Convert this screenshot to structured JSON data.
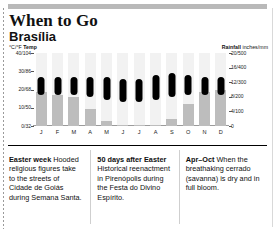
{
  "header": {
    "title": "When to Go",
    "subtitle": "Brasília"
  },
  "axes": {
    "left_label_units": "°C/°F",
    "left_label_name": "Temp",
    "right_label_name": "Rainfall",
    "right_label_units": "inches/mm"
  },
  "chart_data": {
    "type": "bar",
    "categories": [
      "J",
      "F",
      "M",
      "A",
      "M",
      "J",
      "J",
      "A",
      "S",
      "O",
      "N",
      "D"
    ],
    "month_labels": [
      "J",
      "F",
      "M",
      "A",
      "M",
      "J",
      "J",
      "A",
      "S",
      "O",
      "N",
      "D"
    ],
    "xlabel": "",
    "grid": false,
    "legend": "none",
    "series": [
      {
        "name": "Rainfall",
        "type": "bar",
        "unit": "inches/mm",
        "axis": "right",
        "ylabel": "Rainfall",
        "ylim": [
          0,
          20
        ],
        "ticks": [
          "0",
          "4/100",
          "8/200",
          "12/300",
          "16/400",
          "20/500"
        ],
        "tick_values": [
          0,
          4,
          8,
          12,
          16,
          20
        ],
        "values": [
          9.4,
          8.6,
          7.9,
          4.6,
          1.3,
          0.3,
          0.2,
          0.3,
          2.0,
          6.0,
          9.4,
          9.8
        ],
        "values_mm": [
          235,
          215,
          198,
          115,
          33,
          8,
          5,
          8,
          50,
          150,
          235,
          245
        ]
      },
      {
        "name": "Temperature range",
        "type": "range",
        "unit": "°C/°F",
        "axis": "left",
        "ylabel": "Temp",
        "ylim": [
          0,
          40
        ],
        "ticks": [
          "0/32",
          "10/50",
          "20/68",
          "30/86",
          "40/104"
        ],
        "tick_values": [
          0,
          10,
          20,
          30,
          40
        ],
        "low_c": [
          17,
          17,
          17,
          16,
          14,
          13,
          13,
          14,
          16,
          17,
          17,
          17
        ],
        "high_c": [
          27,
          27,
          27,
          27,
          27,
          26,
          26,
          28,
          29,
          28,
          27,
          27
        ]
      }
    ]
  },
  "captions": [
    {
      "heading": "Easter week",
      "text": " Hooded religious figures take to the streets of Cidade de Goiás during Semana Santa."
    },
    {
      "heading": "50 days after Easter",
      "text": " Historical reenactment in Pirenópolis during the Festa do Divino Espírito."
    },
    {
      "heading": "Apr–Oct",
      "text": " When the breathaking cerrado (savanna) is dry and in full bloom."
    }
  ]
}
